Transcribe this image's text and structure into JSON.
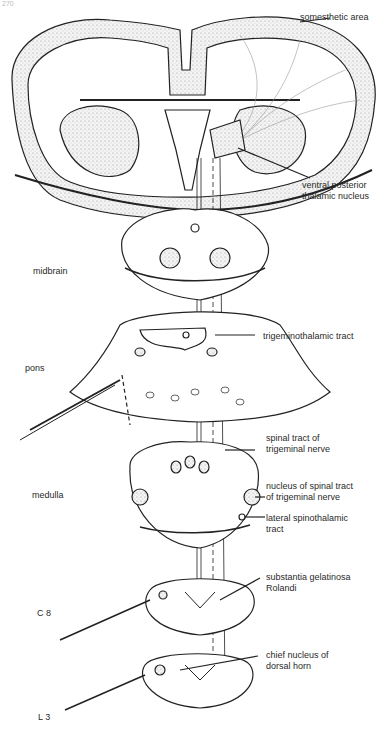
{
  "page": {
    "number": "270"
  },
  "levels": [
    {
      "id": "midbrain",
      "label": "midbrain"
    },
    {
      "id": "pons",
      "label": "pons"
    },
    {
      "id": "medulla",
      "label": "medulla"
    },
    {
      "id": "c8",
      "label": "C 8"
    },
    {
      "id": "l3",
      "label": "L 3"
    }
  ],
  "annotations": [
    {
      "id": "somesthetic-area",
      "lines": [
        "somesthetic area"
      ]
    },
    {
      "id": "ventral-posterior-thalamic-nucleus",
      "lines": [
        "ventral posterior",
        "thalamic nucleus"
      ]
    },
    {
      "id": "trigeminothalamic-tract",
      "lines": [
        "trigeminothalamic tract"
      ]
    },
    {
      "id": "spinal-tract-of-trigeminal-nerve",
      "lines": [
        "spinal tract of",
        "trigeminal nerve"
      ]
    },
    {
      "id": "nucleus-of-spinal-tract",
      "lines": [
        "nucleus of spinal tract",
        "of trigeminal nerve"
      ]
    },
    {
      "id": "lateral-spinothalamic-tract",
      "lines": [
        "lateral spinothalamic",
        "tract"
      ]
    },
    {
      "id": "substantia-gelatinosa",
      "lines": [
        "substantia gelatinosa",
        "Rolandi"
      ]
    },
    {
      "id": "chief-nucleus",
      "lines": [
        "chief nucleus of",
        "dorsal horn"
      ]
    }
  ]
}
